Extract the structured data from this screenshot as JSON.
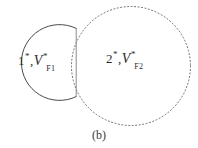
{
  "figure": {
    "caption": "(b)",
    "background_color": "#ffffff",
    "stroke_color": "#555555",
    "label_color": "#2b2b2b",
    "regions": [
      {
        "id": "region-1",
        "shape": "circle-flattened-right",
        "outline_style": "solid",
        "number": "1",
        "number_superscript": "*",
        "variable": "V",
        "variable_superscript": "*",
        "variable_subscript": "F1",
        "separator": ",",
        "full_label": "1*, V*F1",
        "center_x": 40,
        "center_y": 62,
        "radius": 38
      },
      {
        "id": "region-2",
        "shape": "circle",
        "outline_style": "dotted",
        "number": "2",
        "number_superscript": "*",
        "variable": "V",
        "variable_superscript": "*",
        "variable_subscript": "F2",
        "separator": ",",
        "full_label": "2*, V*F2",
        "center_x": 132,
        "center_y": 66,
        "radius": 60
      }
    ],
    "interface": {
      "id": "interface-line",
      "style": "solid",
      "x": 76,
      "y_top": 28,
      "y_bottom": 97
    }
  }
}
